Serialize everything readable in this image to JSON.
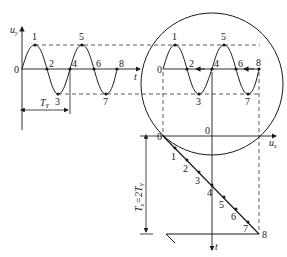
{
  "figure": {
    "type": "oscilloscope-lissajous-construction"
  },
  "left_plot": {
    "y_axis_label": "u",
    "y_axis_sub": "y",
    "x_axis_label": "t",
    "origin_label": "0",
    "period_label": "T",
    "period_sub": "Y",
    "points": [
      "1",
      "2",
      "3",
      "4",
      "5",
      "6",
      "7",
      "8"
    ]
  },
  "screen": {
    "origin_label": "0",
    "points": [
      "1",
      "2",
      "3",
      "4",
      "5",
      "6",
      "7",
      "8"
    ]
  },
  "sweep_plot": {
    "origin_label": "0",
    "center_label": "0",
    "x_axis_label": "u",
    "x_axis_sub": "x",
    "t_axis_label": "t",
    "period_label": "T",
    "period_sub_x": "x",
    "period_eq": "=2T",
    "period_sub_y": "Y",
    "points": [
      "1",
      "2",
      "3",
      "4",
      "5",
      "6",
      "7",
      "8"
    ]
  },
  "colors": {
    "line": "#1a1a1a",
    "dash": "#333333",
    "background": "#ffffff"
  }
}
